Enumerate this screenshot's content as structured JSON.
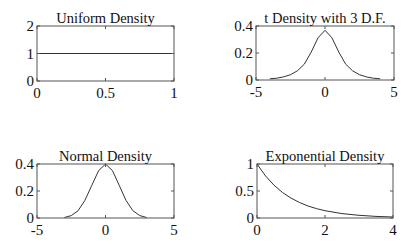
{
  "chart_data": [
    {
      "type": "line",
      "title": "Uniform Density",
      "xlabel": "",
      "ylabel": "",
      "xlim": [
        0,
        1
      ],
      "ylim": [
        0,
        2
      ],
      "xticks": [
        0,
        0.5,
        1
      ],
      "xtick_labels": [
        "0",
        "0.5",
        "1"
      ],
      "yticks": [
        0,
        1,
        2
      ],
      "ytick_labels": [
        "0",
        "1",
        "2"
      ],
      "grid": false,
      "legend": null,
      "series": [
        {
          "name": "uniform pdf",
          "x": [
            0,
            1
          ],
          "y": [
            1,
            1
          ]
        }
      ],
      "box": {
        "left": 37,
        "top": 26,
        "right": 174,
        "bottom": 81
      }
    },
    {
      "type": "line",
      "title": "t Density with 3 D.F.",
      "xlabel": "",
      "ylabel": "",
      "xlim": [
        -5,
        5
      ],
      "ylim": [
        0,
        0.4
      ],
      "xticks": [
        -5,
        0,
        5
      ],
      "xtick_labels": [
        "-5",
        "0",
        "5"
      ],
      "yticks": [
        0,
        0.2,
        0.4
      ],
      "ytick_labels": [
        "0",
        "0.2",
        "0.4"
      ],
      "grid": false,
      "legend": null,
      "series": [
        {
          "name": "t pdf df=3",
          "x": [
            -4,
            -3.5,
            -3,
            -2.5,
            -2,
            -1.5,
            -1,
            -0.5,
            0,
            0.5,
            1,
            1.5,
            2,
            2.5,
            3,
            3.5,
            4
          ],
          "y": [
            0.009,
            0.013,
            0.023,
            0.039,
            0.068,
            0.117,
            0.207,
            0.313,
            0.368,
            0.313,
            0.207,
            0.117,
            0.068,
            0.039,
            0.023,
            0.013,
            0.009
          ]
        }
      ],
      "box": {
        "left": 256,
        "top": 26,
        "right": 394,
        "bottom": 80
      }
    },
    {
      "type": "line",
      "title": "Normal Density",
      "xlabel": "",
      "ylabel": "",
      "xlim": [
        -5,
        5
      ],
      "ylim": [
        0,
        0.4
      ],
      "xticks": [
        -5,
        0,
        5
      ],
      "xtick_labels": [
        "-5",
        "0",
        "5"
      ],
      "yticks": [
        0,
        0.2,
        0.4
      ],
      "ytick_labels": [
        "0",
        "0.2",
        "0.4"
      ],
      "grid": false,
      "legend": null,
      "series": [
        {
          "name": "normal pdf",
          "x": [
            -3,
            -2.5,
            -2,
            -1.5,
            -1,
            -0.5,
            0,
            0.5,
            1,
            1.5,
            2,
            2.5,
            3
          ],
          "y": [
            0.004,
            0.018,
            0.054,
            0.13,
            0.242,
            0.352,
            0.399,
            0.352,
            0.242,
            0.13,
            0.054,
            0.018,
            0.004
          ]
        }
      ],
      "box": {
        "left": 37,
        "top": 164,
        "right": 174,
        "bottom": 218
      }
    },
    {
      "type": "line",
      "title": "Exponential Density",
      "xlabel": "",
      "ylabel": "",
      "xlim": [
        0,
        4
      ],
      "ylim": [
        0,
        1
      ],
      "xticks": [
        0,
        2,
        4
      ],
      "xtick_labels": [
        "0",
        "2",
        "4"
      ],
      "yticks": [
        0,
        0.5,
        1
      ],
      "ytick_labels": [
        "0",
        "0.5",
        "1"
      ],
      "grid": false,
      "legend": null,
      "series": [
        {
          "name": "exponential pdf",
          "x": [
            0,
            0.25,
            0.5,
            0.75,
            1,
            1.25,
            1.5,
            1.75,
            2,
            2.5,
            3,
            3.5,
            4
          ],
          "y": [
            1.0,
            0.779,
            0.607,
            0.472,
            0.368,
            0.287,
            0.223,
            0.174,
            0.135,
            0.082,
            0.05,
            0.03,
            0.018
          ]
        }
      ],
      "box": {
        "left": 257,
        "top": 164,
        "right": 393,
        "bottom": 218
      }
    }
  ]
}
